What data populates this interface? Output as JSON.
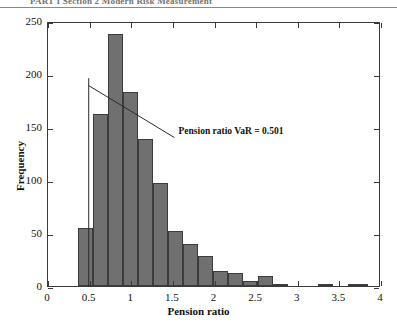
{
  "page_header": {
    "text": "PART I  Section 2  Modern Risk Measurement"
  },
  "chart_data": {
    "type": "bar",
    "title": "",
    "subtitle": "",
    "xlabel": "Pension ratio",
    "ylabel": "Frequency",
    "xlim": [
      0,
      4
    ],
    "ylim": [
      0,
      250
    ],
    "xticks": [
      0,
      0.5,
      1,
      1.5,
      2,
      2.5,
      3,
      3.5,
      4
    ],
    "xticklabels": [
      "0",
      "0.5",
      "1",
      "1.5",
      "2",
      "2.5",
      "3",
      "3.5",
      "4"
    ],
    "yticks": [
      0,
      50,
      100,
      150,
      200,
      250
    ],
    "yticklabels": [
      "0",
      "50",
      "100",
      "150",
      "200",
      "250"
    ],
    "grid": false,
    "legend": null,
    "bin_width": 0.18,
    "bar_color": "#707070",
    "bar_edge_color": "#3c3c3c",
    "bins": [
      {
        "x0": 0.36,
        "x1": 0.54,
        "value": 55
      },
      {
        "x0": 0.54,
        "x1": 0.72,
        "value": 162
      },
      {
        "x0": 0.72,
        "x1": 0.9,
        "value": 238
      },
      {
        "x0": 0.9,
        "x1": 1.08,
        "value": 183
      },
      {
        "x0": 1.08,
        "x1": 1.26,
        "value": 139
      },
      {
        "x0": 1.26,
        "x1": 1.44,
        "value": 97
      },
      {
        "x0": 1.44,
        "x1": 1.62,
        "value": 52
      },
      {
        "x0": 1.62,
        "x1": 1.8,
        "value": 40
      },
      {
        "x0": 1.8,
        "x1": 1.98,
        "value": 28
      },
      {
        "x0": 1.98,
        "x1": 2.16,
        "value": 14
      },
      {
        "x0": 2.16,
        "x1": 2.34,
        "value": 12
      },
      {
        "x0": 2.34,
        "x1": 2.52,
        "value": 5
      },
      {
        "x0": 2.52,
        "x1": 2.7,
        "value": 9
      },
      {
        "x0": 2.7,
        "x1": 2.88,
        "value": 2
      },
      {
        "x0": 3.24,
        "x1": 3.42,
        "value": 2
      },
      {
        "x0": 3.6,
        "x1": 3.84,
        "value": 2
      }
    ],
    "annotations": [
      {
        "name": "pension-ratio-var",
        "text": "Pension ratio VaR = 0.501",
        "value": 0.501,
        "marker_line": {
          "x": 0.501,
          "y_bottom": 0,
          "y_top": 197
        },
        "leader_line": {
          "x1": 0.501,
          "y1": 190,
          "x2": 1.53,
          "y2": 141
        }
      }
    ]
  }
}
